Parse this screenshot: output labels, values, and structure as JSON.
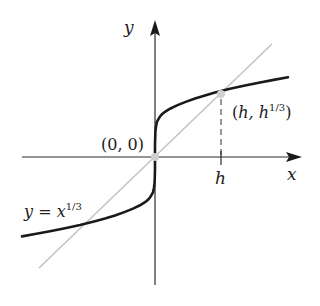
{
  "figure": {
    "type": "graph",
    "function": "y = x^(1/3)",
    "axes": {
      "x_label": "x",
      "y_label": "y"
    },
    "labels": {
      "origin": "(0, 0)",
      "point_h_open": "(",
      "point_h_h": "h",
      "point_h_comma": ", h",
      "point_h_exp": "1/3",
      "point_h_close": ")",
      "tick_h": "h",
      "curve_y": "y",
      "curve_eq": " = ",
      "curve_x": "x",
      "curve_exp": "1/3"
    },
    "points": [
      {
        "name": "origin",
        "label": "(0, 0)"
      },
      {
        "name": "h-point",
        "label": "(h, h^1/3)"
      }
    ],
    "colors": {
      "curve": "#1a1a1a",
      "secant": "#c4c4c4",
      "axis": "#2a2a2a",
      "point": "#cfcfcf"
    }
  }
}
